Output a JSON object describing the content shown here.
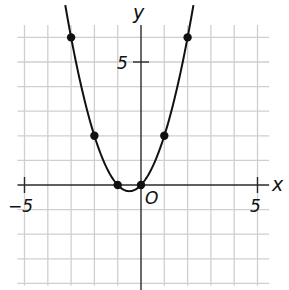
{
  "labels": {
    "x_axis": "x",
    "y_axis": "y",
    "origin": "O",
    "x_neg_tick": "−5",
    "x_pos_tick": "5",
    "y_pos_tick": "5"
  },
  "geometry": {
    "origin_px": [
      141,
      185
    ],
    "unit_x_px": 23.3,
    "unit_y_px": 24.6,
    "grid_x_range": [
      -5.3,
      5.5
    ],
    "grid_y_range": [
      -4.1,
      6.5
    ]
  },
  "chart_data": {
    "type": "line",
    "title": "",
    "xlabel": "x",
    "ylabel": "y",
    "function": "y = x^2 + x",
    "xlim": [
      -5,
      5
    ],
    "ylim": [
      -4,
      6
    ],
    "grid": true,
    "ticks": {
      "x": [
        -5,
        5
      ],
      "y": [
        5
      ]
    },
    "points": [
      {
        "x": -3,
        "y": 6
      },
      {
        "x": -2,
        "y": 2
      },
      {
        "x": -1,
        "y": 0
      },
      {
        "x": 0,
        "y": 0
      },
      {
        "x": 1,
        "y": 2
      },
      {
        "x": 2,
        "y": 6
      }
    ],
    "vertex": {
      "x": -0.5,
      "y": -0.25
    }
  }
}
